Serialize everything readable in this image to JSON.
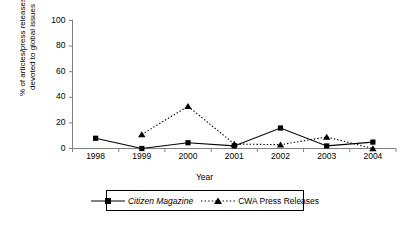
{
  "chart_data": {
    "type": "line",
    "title": "",
    "xlabel": "Year",
    "ylabel": "% of articles/press releases devoted to global issues",
    "ylabel_lines": [
      "% of articles/press releases",
      "devoted to global issues"
    ],
    "categories": [
      "1998",
      "1999",
      "2000",
      "2001",
      "2002",
      "2003",
      "2004"
    ],
    "ylim": [
      0,
      100
    ],
    "yticks": [
      0,
      20,
      40,
      60,
      80,
      100
    ],
    "ytick_labels": [
      "0",
      "20",
      "40",
      "60",
      "80",
      "100"
    ],
    "grid": false,
    "legend_position": "bottom",
    "series": [
      {
        "name": "Citizen Magazine",
        "style": "solid",
        "marker": "square",
        "italic_label": true,
        "color": "#000000",
        "values": [
          8,
          0,
          4.5,
          2,
          16,
          2,
          5
        ]
      },
      {
        "name": "CWA Press Releases",
        "style": "dotted",
        "marker": "triangle",
        "italic_label": false,
        "color": "#000000",
        "values": [
          null,
          11,
          33,
          3.5,
          3,
          9,
          0
        ]
      }
    ]
  },
  "legend": {
    "entries": [
      {
        "label": "Citizen Magazine"
      },
      {
        "label": "CWA Press Releases"
      }
    ]
  },
  "colors": {
    "axis": "#808080",
    "series_1": "#000000",
    "series_2": "#000000",
    "background": "#ffffff"
  }
}
